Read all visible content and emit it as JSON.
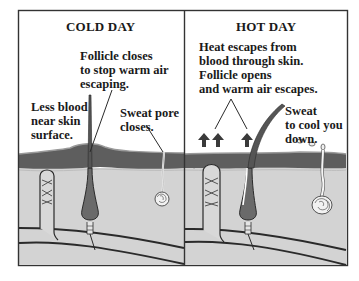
{
  "diagram": {
    "panels": [
      {
        "id": "cold",
        "title": "COLD DAY",
        "labels": {
          "follicle": [
            "Follicle closes",
            "to stop warm air",
            "escaping."
          ],
          "blood": [
            "Less blood",
            "near skin",
            "surface."
          ],
          "sweat": [
            "Sweat pore",
            "closes."
          ]
        }
      },
      {
        "id": "hot",
        "title": "HOT DAY",
        "labels": {
          "heat": [
            "Heat escapes from",
            "blood through skin.",
            "Follicle opens",
            "and warm air escapes."
          ],
          "sweat": [
            "Sweat",
            "to cool you",
            "down."
          ]
        }
      }
    ],
    "colors": {
      "epidermis": "#5e5e5e",
      "dermis": "#d2d2d2",
      "border": "#333333",
      "lines": "#2a2a2a",
      "background": "#ffffff"
    }
  }
}
